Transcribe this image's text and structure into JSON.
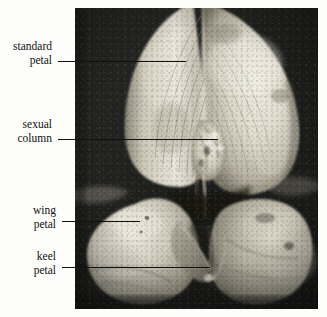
{
  "figure": {
    "kind": "photomicrograph",
    "background_color": "#fdfdfb",
    "photo": {
      "left": 75,
      "top": 8,
      "width": 243,
      "height": 301,
      "dark_background_color": "#252525",
      "petal_highlight_color": "#e6e2d6"
    }
  },
  "labels": [
    {
      "id": "standard-petal",
      "line1": "standard",
      "line2": "petal"
    },
    {
      "id": "sexual-column",
      "line1": "sexual",
      "line2": "column"
    },
    {
      "id": "wing-petal",
      "line1": "wing",
      "line2": "petal"
    },
    {
      "id": "keel-petal",
      "line1": "keel",
      "line2": "petal"
    }
  ],
  "leader_lines": [
    {
      "id": "leader-standard-petal",
      "x1": 58,
      "y": 61,
      "x2": 186
    },
    {
      "id": "leader-sexual-column",
      "x1": 58,
      "y": 139,
      "x2": 218
    },
    {
      "id": "leader-wing-petal",
      "x1": 62,
      "y": 221,
      "x2": 140
    },
    {
      "id": "leader-keel-petal",
      "x1": 62,
      "y": 267,
      "x2": 210
    }
  ]
}
